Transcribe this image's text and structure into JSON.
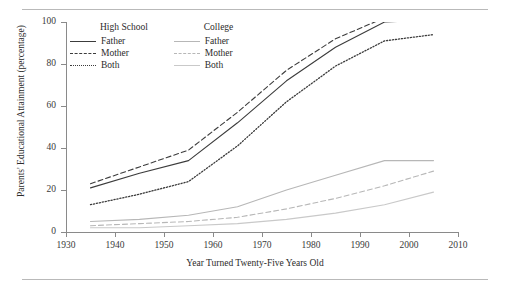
{
  "figure": {
    "has_top_rule": true,
    "has_bottom_rule": true
  },
  "chart_data": {
    "type": "line",
    "title": "",
    "xlabel": "Year Turned Twenty-Five Years Old",
    "ylabel": "Parents' Educational Attainment (percentage)",
    "xlim": [
      1930,
      2010
    ],
    "ylim": [
      0,
      100
    ],
    "xticks": [
      1930,
      1940,
      1950,
      1960,
      1970,
      1980,
      1990,
      2000,
      2010
    ],
    "yticks": [
      0,
      20,
      40,
      60,
      80,
      100
    ],
    "grid": false,
    "legend_position": "top-left-inside",
    "legend_groups": [
      {
        "heading": "High School",
        "entries": [
          {
            "label": "Father",
            "style": "solid",
            "color": "#3c3c3c"
          },
          {
            "label": "Mother",
            "style": "dashed",
            "color": "#3c3c3c"
          },
          {
            "label": "Both",
            "style": "dotted",
            "color": "#3c3c3c"
          }
        ]
      },
      {
        "heading": "College",
        "entries": [
          {
            "label": "Father",
            "style": "solid",
            "color": "#b7b7b7"
          },
          {
            "label": "Mother",
            "style": "dashed",
            "color": "#b7b7b7"
          },
          {
            "label": "Both",
            "style": "solid",
            "color": "#c9c9c9"
          }
        ]
      }
    ],
    "x": [
      1935,
      1945,
      1955,
      1965,
      1975,
      1985,
      1995,
      2005
    ],
    "series": [
      {
        "name": "High School - Father",
        "group": "High School",
        "style": "solid",
        "color": "#3c3c3c",
        "values": [
          21,
          28,
          34,
          52,
          72,
          88,
          100,
          101
        ]
      },
      {
        "name": "High School - Mother",
        "group": "High School",
        "style": "dashed",
        "color": "#3c3c3c",
        "values": [
          23,
          31,
          39,
          57,
          77,
          92,
          102,
          103
        ]
      },
      {
        "name": "High School - Both",
        "group": "High School",
        "style": "dotted",
        "color": "#3c3c3c",
        "values": [
          13,
          18,
          24,
          41,
          62,
          79,
          91,
          94
        ]
      },
      {
        "name": "College - Father",
        "group": "College",
        "style": "solid",
        "color": "#b7b7b7",
        "values": [
          5,
          6,
          8,
          12,
          20,
          27,
          34,
          34
        ]
      },
      {
        "name": "College - Mother",
        "group": "College",
        "style": "dashed",
        "color": "#b7b7b7",
        "values": [
          3,
          4,
          5,
          7,
          11,
          16,
          22,
          29
        ]
      },
      {
        "name": "College - Both",
        "group": "College",
        "style": "solid",
        "color": "#c9c9c9",
        "values": [
          2,
          2,
          3,
          4,
          6,
          9,
          13,
          19
        ]
      }
    ]
  }
}
